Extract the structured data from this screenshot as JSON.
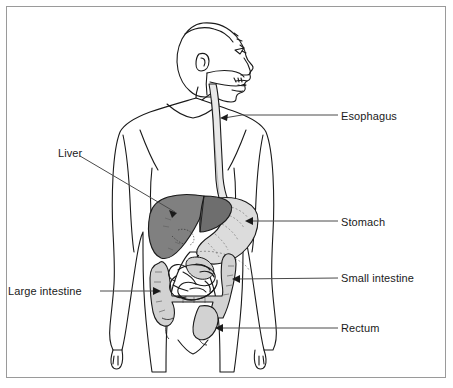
{
  "figure": {
    "background_color": "#ffffff",
    "border_color": "#9a9a9a",
    "outline_color": "#1a1a1a",
    "leader_color": "#4a4a4a"
  },
  "palette": {
    "liver_fill": "#808080",
    "liver_dark": "#6e6e6e",
    "stomach_fill": "#dcdcdc",
    "intestine_fill": "#d2d2d2",
    "body_fill": "#ffffff",
    "esophagus_fill": "#e8e8e8"
  },
  "labels": [
    {
      "id": "esophagus",
      "text": "Esophagus",
      "side": "right",
      "x": 341,
      "y": 110,
      "arrow_to_x": 221,
      "arrow_to_y": 118
    },
    {
      "id": "stomach",
      "text": "Stomach",
      "side": "right",
      "x": 341,
      "y": 216,
      "arrow_to_x": 246,
      "arrow_to_y": 221
    },
    {
      "id": "small-intestine",
      "text": "Small intestine",
      "side": "right",
      "x": 341,
      "y": 272,
      "arrow_to_x": 233,
      "arrow_to_y": 279
    },
    {
      "id": "rectum",
      "text": "Rectum",
      "side": "right",
      "x": 341,
      "y": 322,
      "arrow_to_x": 216,
      "arrow_to_y": 328
    },
    {
      "id": "liver",
      "text": "Liver",
      "side": "left",
      "x": 58,
      "y": 147,
      "arrow_to_x": 177,
      "arrow_to_y": 213
    },
    {
      "id": "large-intestine",
      "text": "Large intestine",
      "side": "left",
      "x": 8,
      "y": 285,
      "arrow_to_x": 160,
      "arrow_to_y": 291
    }
  ],
  "organs": [
    {
      "id": "esophagus",
      "name": "Esophagus",
      "shade": "#e8e8e8"
    },
    {
      "id": "stomach",
      "name": "Stomach",
      "shade": "#dcdcdc"
    },
    {
      "id": "liver",
      "name": "Liver",
      "shade": "#808080"
    },
    {
      "id": "small-intestine",
      "name": "Small intestine",
      "shade": "#d2d2d2"
    },
    {
      "id": "large-intestine",
      "name": "Large intestine",
      "shade": "#d2d2d2"
    },
    {
      "id": "rectum",
      "name": "Rectum",
      "shade": "#d2d2d2"
    }
  ]
}
